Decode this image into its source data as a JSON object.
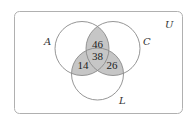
{
  "diagram": {
    "type": "venn",
    "universe_label": "U",
    "sets": [
      {
        "name": "A",
        "label": "A"
      },
      {
        "name": "C",
        "label": "C"
      },
      {
        "name": "L",
        "label": "L"
      }
    ],
    "regions": {
      "A_and_C_only": "46",
      "A_and_C_and_L": "38",
      "A_and_L_only": "14",
      "C_and_L_only": "26"
    },
    "colors": {
      "shade": "#c6c6c6",
      "circle_stroke": "#8a8a8a",
      "frame_stroke": "#b0b0b0"
    }
  }
}
